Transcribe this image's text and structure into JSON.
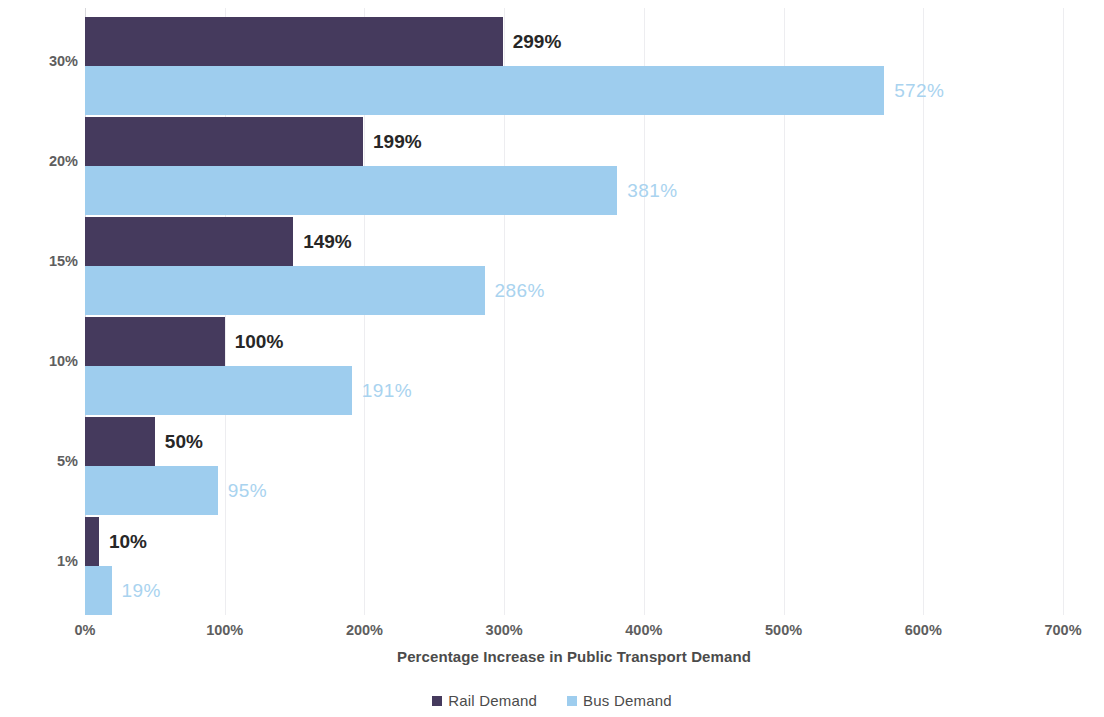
{
  "chart_data": {
    "type": "bar",
    "orientation": "horizontal",
    "title": "",
    "xlabel": "Percentage Increase in Public Transport Demand",
    "ylabel": "Percetage of Car Demand Switched",
    "categories": [
      "30%",
      "20%",
      "15%",
      "10%",
      "5%",
      "1%"
    ],
    "series": [
      {
        "name": "Rail Demand",
        "color": "#453a5d",
        "values": [
          299,
          199,
          149,
          100,
          50,
          10
        ],
        "labels": [
          "299%",
          "199%",
          "149%",
          "100%",
          "50%",
          "10%"
        ]
      },
      {
        "name": "Bus Demand",
        "color": "#9ecdee",
        "values": [
          572,
          381,
          286,
          191,
          95,
          19
        ],
        "labels": [
          "572%",
          "381%",
          "286%",
          "191%",
          "95%",
          "19%"
        ]
      }
    ],
    "xlim": [
      0,
      700
    ],
    "x_ticks": [
      0,
      100,
      200,
      300,
      400,
      500,
      600,
      700
    ],
    "x_tick_labels": [
      "0%",
      "100%",
      "200%",
      "300%",
      "400%",
      "500%",
      "600%",
      "700%"
    ],
    "grid": "vertical",
    "legend_position": "bottom",
    "value_label_colors": {
      "rail": "#272727",
      "bus": "#a9d3ef"
    },
    "background": "#ffffff"
  },
  "legend": {
    "items": [
      {
        "label": "Rail Demand",
        "color": "#453a5d"
      },
      {
        "label": "Bus Demand",
        "color": "#9ecdee"
      }
    ]
  }
}
